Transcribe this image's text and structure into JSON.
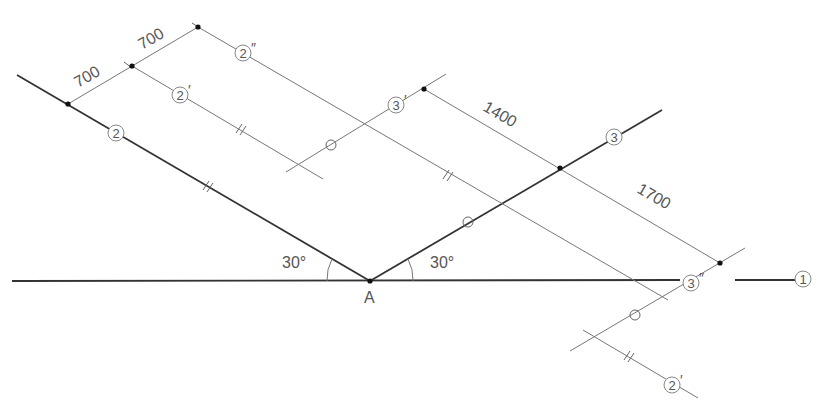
{
  "diagram": {
    "point_label": "A",
    "angles": [
      {
        "id": "left",
        "text": "30°"
      },
      {
        "id": "right",
        "text": "30°"
      }
    ],
    "dimensions": [
      {
        "id": "d700a",
        "text": "700"
      },
      {
        "id": "d700b",
        "text": "700"
      },
      {
        "id": "d1400",
        "text": "1400"
      },
      {
        "id": "d1700",
        "text": "1700"
      }
    ],
    "line_labels": {
      "l1": {
        "num": "1",
        "prime": ""
      },
      "l2": {
        "num": "2",
        "prime": ""
      },
      "l2p_top": {
        "num": "2",
        "prime": "′"
      },
      "l2pp": {
        "num": "2",
        "prime": "″"
      },
      "l2p_bottom": {
        "num": "2",
        "prime": "′"
      },
      "l3": {
        "num": "3",
        "prime": ""
      },
      "l3p": {
        "num": "3",
        "prime": "′"
      },
      "l3pp": {
        "num": "3",
        "prime": "″"
      }
    }
  }
}
